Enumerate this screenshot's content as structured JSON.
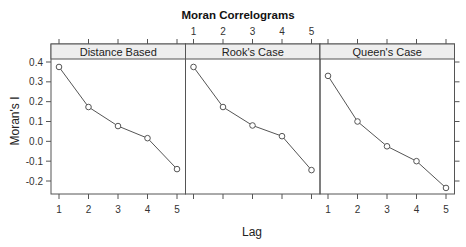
{
  "chart_data": {
    "type": "line",
    "title": "Moran Correlograms",
    "xlabel": "Lag",
    "ylabel": "Moran's I",
    "x": [
      1,
      2,
      3,
      4,
      5
    ],
    "xticks": [
      "1",
      "2",
      "3",
      "4",
      "5"
    ],
    "yticks": [
      "0.4",
      "0.3",
      "0.2",
      "0.1",
      "0.0",
      "-0.1",
      "-0.2"
    ],
    "ytick_values": [
      0.4,
      0.3,
      0.2,
      0.1,
      0.0,
      -0.1,
      -0.2
    ],
    "ylim": [
      -0.27,
      0.43
    ],
    "xlim": [
      0.7,
      5.3
    ],
    "grid": false,
    "legend": null,
    "marker": "open-circle",
    "panels": [
      {
        "name": "Distance Based",
        "values": [
          0.375,
          0.173,
          0.077,
          0.016,
          -0.14
        ]
      },
      {
        "name": "Rook's Case",
        "values": [
          0.375,
          0.173,
          0.08,
          0.026,
          -0.145
        ]
      },
      {
        "name": "Queen's Case",
        "values": [
          0.33,
          0.1,
          -0.025,
          -0.1,
          -0.235
        ]
      }
    ]
  },
  "colors": {
    "line": "#555555",
    "axis": "#555555",
    "strip_bg": "#eeeeee",
    "background": "#ffffff"
  }
}
